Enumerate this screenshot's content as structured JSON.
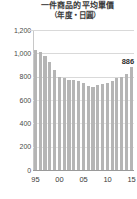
{
  "chart_data": {
    "type": "bar",
    "title": "一件商品的平均單價",
    "subtitle": "（年度・日圓）",
    "xlabel": "",
    "ylabel": "",
    "ylim": [
      0,
      1200
    ],
    "ytick_values": [
      0,
      200,
      400,
      600,
      800,
      1000,
      1200
    ],
    "ytick_labels": [
      "0",
      "200",
      "400",
      "600",
      "800",
      "1,000",
      "1,200"
    ],
    "grid": true,
    "legend": null,
    "categories": [
      "95",
      "96",
      "97",
      "98",
      "99",
      "00",
      "01",
      "02",
      "03",
      "04",
      "05",
      "06",
      "07",
      "08",
      "09",
      "10",
      "11",
      "12",
      "13",
      "14",
      "15"
    ],
    "xtick_labels": [
      "95",
      "00",
      "05",
      "10",
      "15"
    ],
    "xtick_positions": [
      0,
      5,
      10,
      15,
      20
    ],
    "values": [
      1030,
      1015,
      975,
      930,
      855,
      800,
      785,
      775,
      770,
      760,
      745,
      720,
      715,
      725,
      735,
      750,
      760,
      785,
      800,
      825,
      886
    ],
    "annotations": [
      {
        "label": "886",
        "category": "15",
        "value": 886
      }
    ],
    "bar_color": "#b5b5b5",
    "grid_color": "#d9d9d9",
    "text_color": "#3a3a3a"
  }
}
